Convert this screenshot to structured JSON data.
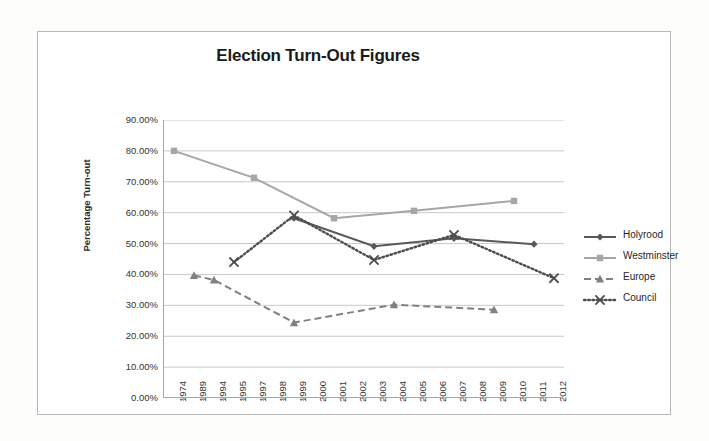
{
  "chart_data": {
    "type": "line",
    "title": "Election Turn-Out Figures",
    "xlabel": "",
    "ylabel": "Percentage Turn-out",
    "ylim": [
      0,
      90
    ],
    "ytick_labels": [
      "90.00%",
      "80.00%",
      "70.00%",
      "60.00%",
      "50.00%",
      "40.00%",
      "30.00%",
      "20.00%",
      "10.00%",
      "0.00%"
    ],
    "ytick_values": [
      90,
      80,
      70,
      60,
      50,
      40,
      30,
      20,
      10,
      0
    ],
    "grid": "horizontal",
    "legend_position": "right",
    "categories": [
      "1974",
      "1989",
      "1994",
      "1995",
      "1997",
      "1998",
      "1999",
      "2000",
      "2001",
      "2002",
      "2003",
      "2004",
      "2005",
      "2006",
      "2007",
      "2008",
      "2009",
      "2010",
      "2011",
      "2012"
    ],
    "series": [
      {
        "name": "Holyrood",
        "color": "#595959",
        "line_style": "solid",
        "marker": "diamond",
        "points": [
          {
            "x": "1999",
            "y": 58.2
          },
          {
            "x": "2003",
            "y": 49.1
          },
          {
            "x": "2007",
            "y": 51.7
          },
          {
            "x": "2011",
            "y": 49.8
          }
        ]
      },
      {
        "name": "Westminster",
        "color": "#a6a6a6",
        "line_style": "solid",
        "marker": "square",
        "points": [
          {
            "x": "1974",
            "y": 80.0
          },
          {
            "x": "1997",
            "y": 71.3
          },
          {
            "x": "2001",
            "y": 58.2
          },
          {
            "x": "2005",
            "y": 60.6
          },
          {
            "x": "2010",
            "y": 63.8
          }
        ]
      },
      {
        "name": "Europe",
        "color": "#808080",
        "line_style": "dashed",
        "marker": "triangle",
        "points": [
          {
            "x": "1989",
            "y": 39.7
          },
          {
            "x": "1994",
            "y": 38.2
          },
          {
            "x": "1999",
            "y": 24.4
          },
          {
            "x": "2004",
            "y": 30.2
          },
          {
            "x": "2009",
            "y": 28.6
          }
        ]
      },
      {
        "name": "Council",
        "color": "#4d4d4d",
        "line_style": "dotted",
        "marker": "cross",
        "points": [
          {
            "x": "1995",
            "y": 44.0
          },
          {
            "x": "1999",
            "y": 59.1
          },
          {
            "x": "2003",
            "y": 44.7
          },
          {
            "x": "2007",
            "y": 52.8
          },
          {
            "x": "2012",
            "y": 38.8
          }
        ]
      }
    ]
  },
  "legend": {
    "items": [
      {
        "label": "Holyrood"
      },
      {
        "label": "Westminster"
      },
      {
        "label": "Europe"
      },
      {
        "label": "Council"
      }
    ]
  }
}
